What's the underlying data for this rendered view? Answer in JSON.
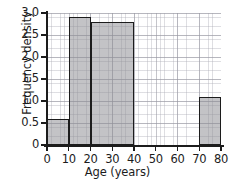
{
  "chart_data": {
    "type": "bar",
    "title": "",
    "subtitle": "",
    "xlabel": "Age (years)",
    "ylabel": "Frequency density",
    "xlim": [
      0,
      80
    ],
    "ylim": [
      0,
      3.0
    ],
    "grid": true,
    "legend": null,
    "x_ticks": [
      "0",
      "10",
      "20",
      "30",
      "40",
      "50",
      "60",
      "70",
      "80"
    ],
    "x_tick_values": [
      0,
      10,
      20,
      30,
      40,
      50,
      60,
      70,
      80
    ],
    "y_ticks": [
      "0",
      "0.5",
      "1.0",
      "1.5",
      "2.0",
      "2.5",
      "3.0"
    ],
    "y_tick_values": [
      0,
      0.5,
      1.0,
      1.5,
      2.0,
      2.5,
      3.0
    ],
    "x_minor_step": 2,
    "y_minor_step": 0.1,
    "bins": [
      {
        "label": "0-10",
        "x_start": 0,
        "x_end": 10,
        "value": 0.6
      },
      {
        "label": "10-20",
        "x_start": 10,
        "x_end": 20,
        "value": 2.9
      },
      {
        "label": "20-40",
        "x_start": 20,
        "x_end": 40,
        "value": 2.8
      },
      {
        "label": "70-80",
        "x_start": 70,
        "x_end": 80,
        "value": 1.1
      }
    ],
    "bar_fill_color": "#8c8c92",
    "bar_edge_color": "#1c1c1c",
    "axis_color": "#1c1c1c",
    "grid_color": "#9696a0",
    "background_color": "#ffffff"
  }
}
